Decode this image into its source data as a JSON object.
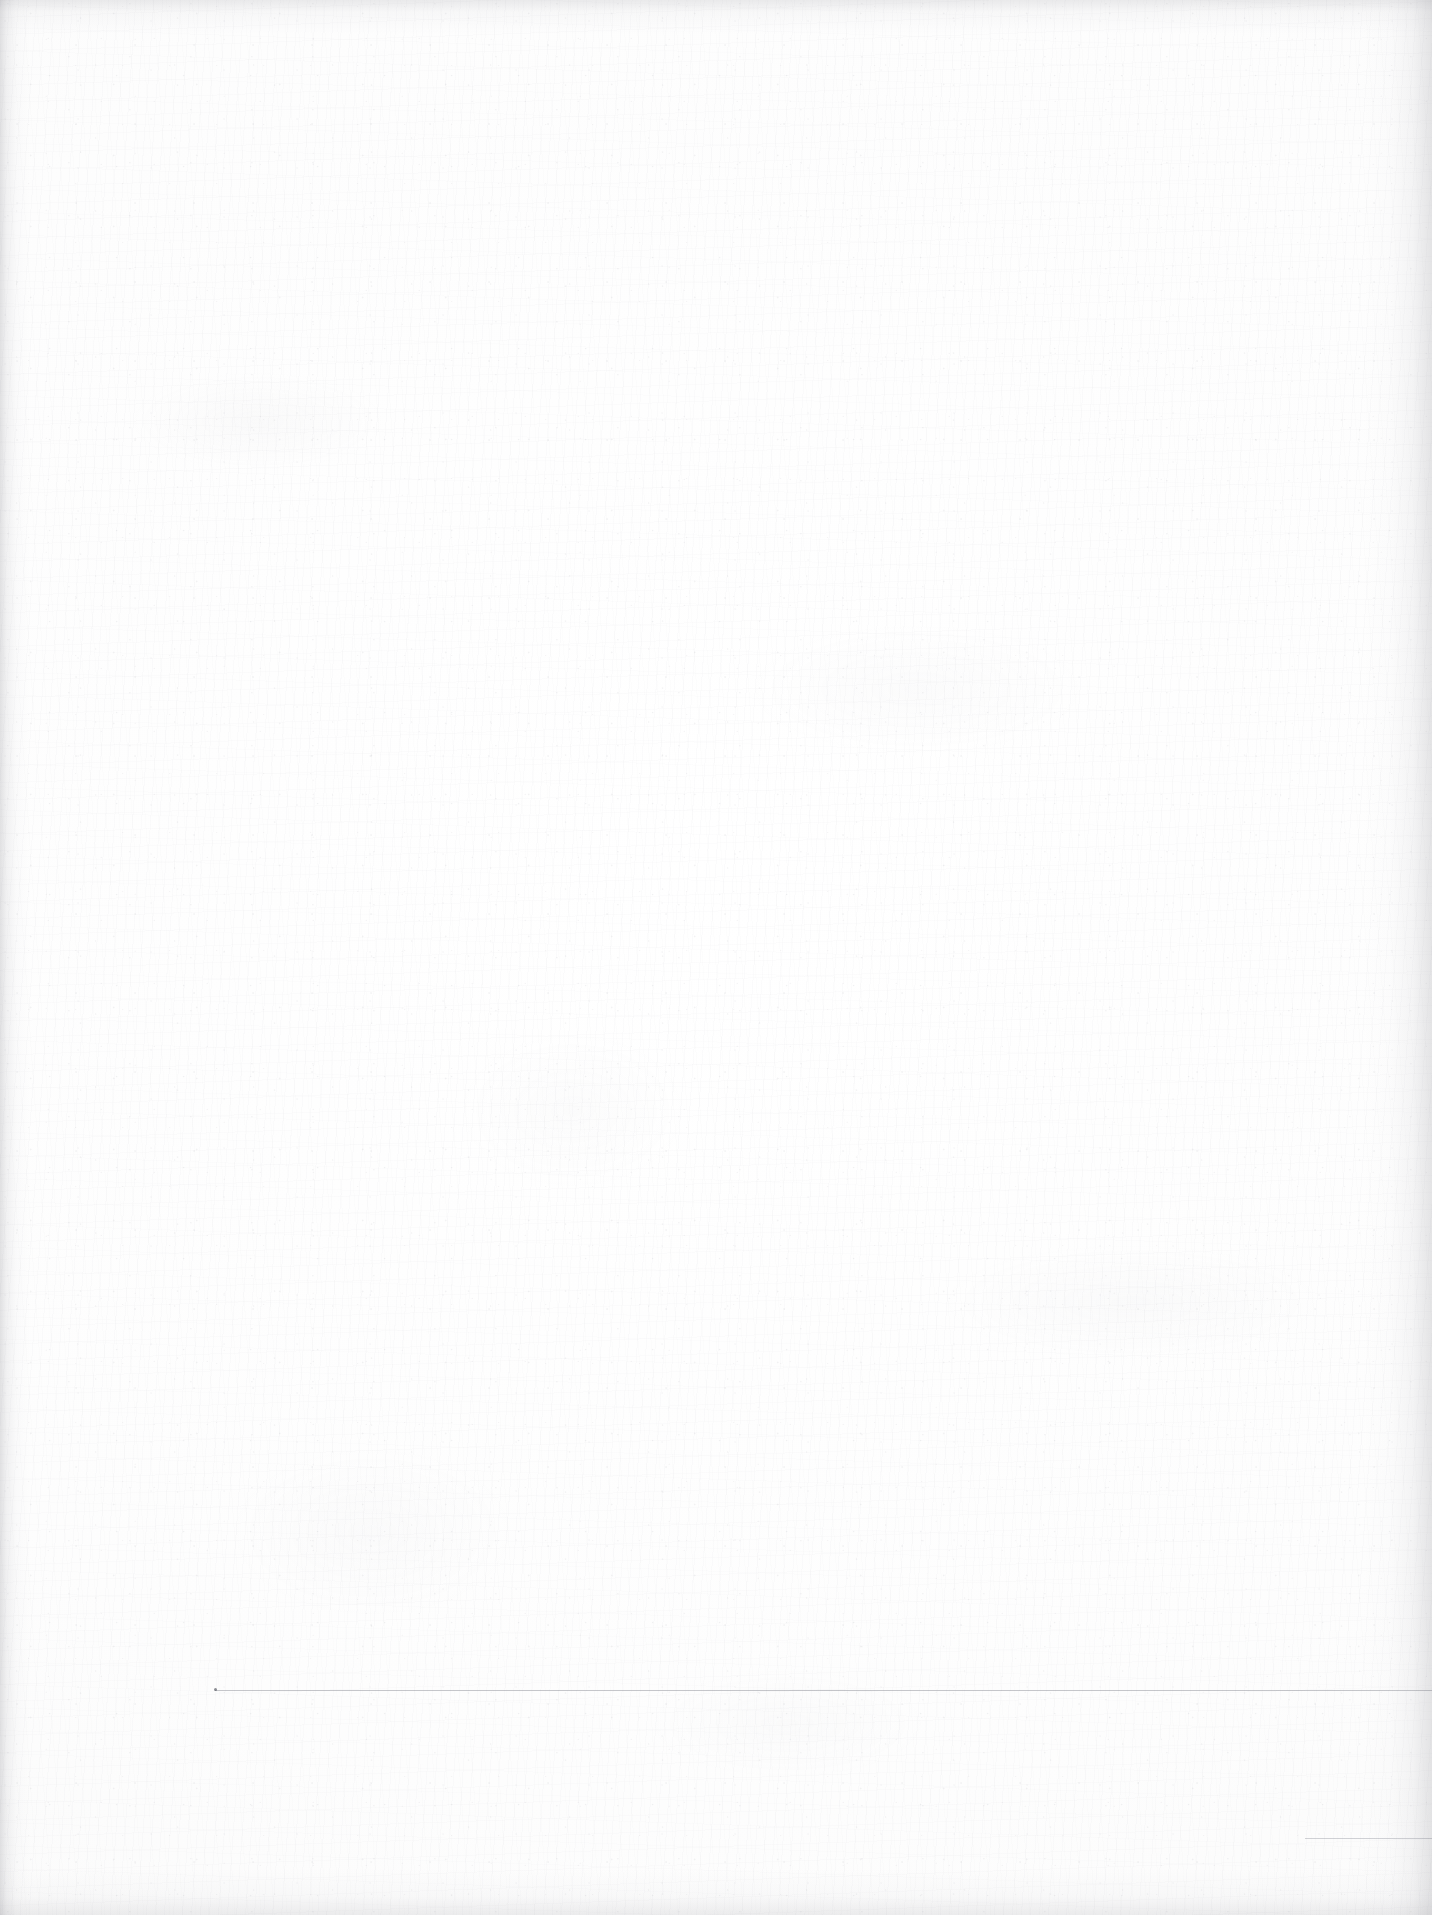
{
  "document": {
    "kind": "scanned-page",
    "page_label": "",
    "body_text": "",
    "header_text": "",
    "footer_text": "",
    "is_blank": "true"
  },
  "canvas": {
    "width": 1432,
    "height": 1915,
    "background_color": "#fdfdfd",
    "paper_tone": "#fafafa"
  },
  "marks": {
    "rules": [
      {
        "name": "lower-horizontal-rule",
        "x": 215,
        "y": 1690,
        "width": 1217,
        "color": "#787a84",
        "has_left_dot": "true"
      },
      {
        "name": "bottom-right-horizontal-rule",
        "x": 1305,
        "y": 1838,
        "width": 127,
        "color": "#8a8c96",
        "has_left_dot": "false"
      }
    ]
  },
  "edges": {
    "left_shadow_color": "#787880",
    "right_shadow_color": "#7d7d85",
    "top_shadow_color": "#82828a",
    "bottom_shadow_color": "#82828a"
  }
}
